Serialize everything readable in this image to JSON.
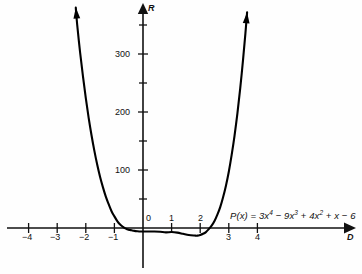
{
  "chart_data": {
    "type": "line",
    "title": "",
    "subtitle": "",
    "xlabel": "D",
    "ylabel": "R",
    "grid": false,
    "legend": null,
    "xlim": [
      -4.7,
      4.9
    ],
    "ylim": [
      -70,
      380
    ],
    "x_ticks": [
      -4,
      -3,
      -2,
      -1,
      0,
      1,
      2,
      3,
      4
    ],
    "x_ticklabels": [
      "−4",
      "−3",
      "−2",
      "−1",
      "0",
      "1",
      "2",
      "3",
      "4"
    ],
    "y_ticks": [
      50,
      100,
      150,
      200,
      250,
      300,
      350
    ],
    "y_ticklabels_major": [
      "100",
      "200",
      "300"
    ],
    "y_major_ticks": [
      100,
      200,
      300
    ],
    "y_minor_ticks": [
      50,
      150,
      250,
      350
    ],
    "annotation": {
      "equation_plain": "P(x) = 3x^4 − 9x^3 + 4x^2 + x − 6",
      "prefix": "P(x) = 3x",
      "exp1": "4",
      "term2_op": " − ",
      "term2": "9x",
      "exp2": "3",
      "term3_op": " + ",
      "term3": "4x",
      "exp3": "2",
      "term4": " + x ",
      "term5_op": "−",
      "term5": " 6"
    },
    "series": [
      {
        "name": "P(x) = 3x^4 - 9x^3 + 4x^2 + x - 6",
        "color": "#000000",
        "linewidth": 2.1,
        "arrow_ends": [
          "left-up",
          "right-up"
        ],
        "points": [
          {
            "x": -2.35,
            "y": 380
          },
          {
            "x": -2.3,
            "y": 350
          },
          {
            "x": -2.2,
            "y": 303
          },
          {
            "x": -2.1,
            "y": 262
          },
          {
            "x": -2.0,
            "y": 224
          },
          {
            "x": -1.9,
            "y": 190
          },
          {
            "x": -1.8,
            "y": 160
          },
          {
            "x": -1.7,
            "y": 133
          },
          {
            "x": -1.6,
            "y": 109
          },
          {
            "x": -1.5,
            "y": 88
          },
          {
            "x": -1.4,
            "y": 70
          },
          {
            "x": -1.3,
            "y": 54
          },
          {
            "x": -1.2,
            "y": 41
          },
          {
            "x": -1.1,
            "y": 29
          },
          {
            "x": -1.0,
            "y": 20
          },
          {
            "x": -0.9,
            "y": 12
          },
          {
            "x": -0.8,
            "y": 6
          },
          {
            "x": -0.7,
            "y": 2
          },
          {
            "x": -0.6,
            "y": -1
          },
          {
            "x": -0.5,
            "y": -3
          },
          {
            "x": -0.45,
            "y": -3.5
          },
          {
            "x": -0.4,
            "y": -4
          },
          {
            "x": -0.3,
            "y": -5
          },
          {
            "x": -0.2,
            "y": -5.6
          },
          {
            "x": -0.1,
            "y": -6
          },
          {
            "x": 0.0,
            "y": -6
          },
          {
            "x": 0.2,
            "y": -6
          },
          {
            "x": 0.4,
            "y": -6
          },
          {
            "x": 0.6,
            "y": -6.5
          },
          {
            "x": 0.8,
            "y": -7.5
          },
          {
            "x": 1.0,
            "y": -7
          },
          {
            "x": 1.2,
            "y": -8
          },
          {
            "x": 1.4,
            "y": -10
          },
          {
            "x": 1.6,
            "y": -12
          },
          {
            "x": 1.8,
            "y": -13
          },
          {
            "x": 1.9,
            "y": -13.2
          },
          {
            "x": 2.0,
            "y": -12
          },
          {
            "x": 2.1,
            "y": -10
          },
          {
            "x": 2.2,
            "y": -7
          },
          {
            "x": 2.3,
            "y": -2
          },
          {
            "x": 2.4,
            "y": 4
          },
          {
            "x": 2.5,
            "y": 12
          },
          {
            "x": 2.6,
            "y": 23
          },
          {
            "x": 2.7,
            "y": 36
          },
          {
            "x": 2.8,
            "y": 53
          },
          {
            "x": 2.9,
            "y": 73
          },
          {
            "x": 3.0,
            "y": 97
          },
          {
            "x": 3.1,
            "y": 126
          },
          {
            "x": 3.2,
            "y": 159
          },
          {
            "x": 3.3,
            "y": 197
          },
          {
            "x": 3.4,
            "y": 241
          },
          {
            "x": 3.5,
            "y": 291
          },
          {
            "x": 3.58,
            "y": 335
          },
          {
            "x": 3.64,
            "y": 372
          }
        ]
      }
    ],
    "roots_visible": [
      -0.45,
      2.32
    ]
  },
  "axes": {
    "y_axis_label": "R",
    "x_axis_label": "D",
    "y_label_300": "300",
    "y_label_200": "200",
    "y_label_100": "100",
    "x_label_m4": "−4",
    "x_label_m3": "−3",
    "x_label_m2": "−2",
    "x_label_m1": "−1",
    "x_label_0": "0",
    "x_label_1": "1",
    "x_label_2": "2",
    "x_label_3": "3",
    "x_label_4": "4"
  },
  "colors": {
    "curve": "#000000",
    "axis": "#111111",
    "background": "#fefefe",
    "text": "#111111"
  }
}
